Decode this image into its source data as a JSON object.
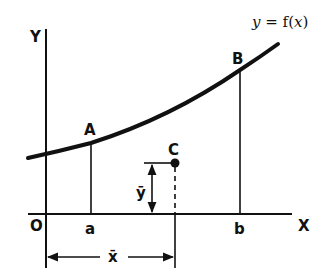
{
  "diagram": {
    "curve_label": "y = f(x)",
    "curve_label_parts": {
      "y": "y",
      "eq": " = f(",
      "x": "x",
      "close": ")"
    },
    "axes": {
      "x_label": "X",
      "y_label": "Y",
      "origin_label": "O"
    },
    "points": {
      "A": "A",
      "B": "B",
      "C": "C"
    },
    "bounds": {
      "a": "a",
      "b": "b"
    },
    "centroid_dims": {
      "x_bar": "x̄",
      "y_bar": "ȳ"
    },
    "colors": {
      "ink": "#111111",
      "background": "#ffffff"
    }
  }
}
